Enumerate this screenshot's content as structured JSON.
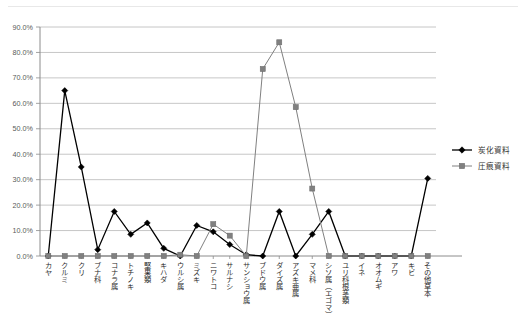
{
  "chart_data": {
    "type": "line",
    "title": "",
    "xlabel": "",
    "ylabel": "",
    "ylim": [
      0,
      90
    ],
    "ytick_labels": [
      "0.0%",
      "10.0%",
      "20.0%",
      "30.0%",
      "40.0%",
      "50.0%",
      "60.0%",
      "70.0%",
      "80.0%",
      "90.0%"
    ],
    "ytick_values": [
      0,
      10,
      20,
      30,
      40,
      50,
      60,
      70,
      80,
      90
    ],
    "grid": "horizontal",
    "legend_position": "right",
    "categories": [
      "カヤ",
      "クルミ",
      "クリ",
      "ブナ科",
      "コナラ属",
      "トチノキ",
      "堅果類",
      "キハダ",
      "ウルシ属",
      "ミズキ",
      "ニワトコ",
      "サルナシ",
      "サンショウ属",
      "ブドウ属",
      "ダイズ属",
      "アズキ亜属",
      "マメ科",
      "シソ属（エゴマ）",
      "ユリ科根茎類",
      "イネ",
      "オオムギ",
      "アワ",
      "キビ",
      "その他草本"
    ],
    "series": [
      {
        "name": "炭化資料",
        "marker": "diamond",
        "color": "#000000",
        "values": [
          0.0,
          65.0,
          35.0,
          2.5,
          17.5,
          8.5,
          13.0,
          3.0,
          0.0,
          12.0,
          9.5,
          4.5,
          0.5,
          0.0,
          17.5,
          0.0,
          8.5,
          17.5,
          0.0,
          0.0,
          0.0,
          0.0,
          0.0,
          30.5
        ]
      },
      {
        "name": "圧痕資料",
        "marker": "square",
        "color": "#808080",
        "values": [
          0.0,
          0.0,
          0.0,
          0.0,
          0.0,
          0.0,
          0.0,
          0.0,
          0.5,
          0.0,
          12.5,
          8.0,
          0.0,
          73.5,
          84.0,
          58.5,
          26.5,
          0.0,
          0.0,
          0.0,
          0.0,
          0.0,
          0.0,
          0.0
        ]
      }
    ]
  },
  "legend": {
    "items": [
      {
        "label": "炭化資料",
        "color": "#000000",
        "marker": "diamond"
      },
      {
        "label": "圧痕資料",
        "color": "#808080",
        "marker": "square"
      }
    ]
  }
}
